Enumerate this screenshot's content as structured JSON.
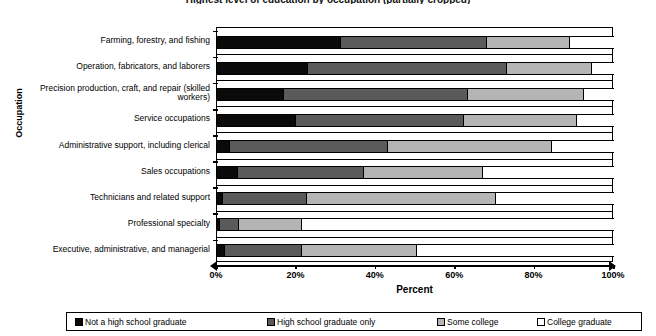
{
  "title": "Highest level of education by occupation (partially cropped)",
  "axes": {
    "y_title": "Occupation",
    "x_title": "Percent",
    "x_ticks": [
      "0%",
      "20%",
      "40%",
      "60%",
      "80%",
      "100%"
    ]
  },
  "legend": {
    "items": [
      {
        "label": "Not a high school graduate",
        "swatch": "#0a0a0a",
        "icon": "legend-swatch-icon"
      },
      {
        "label": "High school graduate only",
        "swatch": "#5a5a5a",
        "icon": "legend-swatch-icon"
      },
      {
        "label": "Some college",
        "swatch": "#b4b4b4",
        "icon": "legend-swatch-icon"
      },
      {
        "label": "College graduate",
        "swatch": "#ffffff",
        "icon": "legend-swatch-icon"
      }
    ]
  },
  "chart_data": {
    "type": "bar",
    "orientation": "horizontal",
    "stacked": true,
    "stack_mode": "percent",
    "title": "Highest level of education by occupation",
    "xlabel": "Percent",
    "ylabel": "Occupation",
    "xlim": [
      0,
      100
    ],
    "xticks": [
      0,
      20,
      40,
      60,
      80,
      100
    ],
    "grid": false,
    "legend_position": "bottom",
    "categories": [
      "Farming, forestry, and fishing",
      "Operation, fabricators, and laborers",
      "Precision production, craft, and repair (skilled workers)",
      "Service occupations",
      "Administrative support, including clerical",
      "Sales occupations",
      "Technicians and related support",
      "Professional specialty",
      "Executive, administrative, and managerial"
    ],
    "series": [
      {
        "name": "Not a high school graduate",
        "color": "#0a0a0a",
        "values": [
          31.3,
          23.0,
          17.0,
          20.0,
          3.3,
          5.2,
          1.5,
          0.7,
          2.1
        ]
      },
      {
        "name": "High school graduate only",
        "color": "#5a5a5a",
        "values": [
          36.7,
          50.0,
          46.3,
          42.3,
          39.7,
          31.8,
          21.2,
          4.8,
          19.4
        ]
      },
      {
        "name": "Some college",
        "color": "#b4b4b4",
        "values": [
          21.0,
          21.5,
          29.2,
          28.5,
          41.3,
          30.0,
          47.6,
          16.0,
          28.9
        ]
      },
      {
        "name": "College graduate",
        "color": "#ffffff",
        "values": [
          11.0,
          5.5,
          7.5,
          9.2,
          15.7,
          33.0,
          29.7,
          78.5,
          49.6
        ]
      }
    ]
  }
}
